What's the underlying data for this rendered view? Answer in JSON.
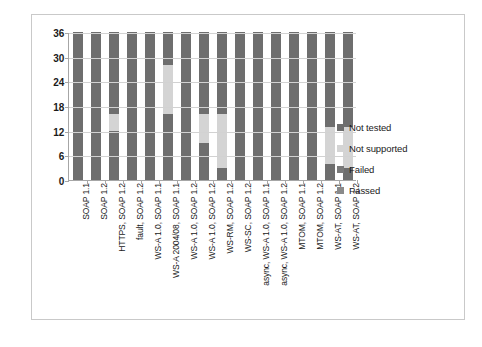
{
  "chart_data": {
    "type": "bar",
    "stacked": true,
    "title": "",
    "xlabel": "",
    "ylabel": "",
    "ylim": [
      0,
      36
    ],
    "yticks": [
      0,
      6,
      12,
      18,
      24,
      30,
      36
    ],
    "grid": true,
    "legend_position": "right",
    "categories": [
      "SOAP 1.1",
      "SOAP 1.2",
      "HTTPS, SOAP 1.2",
      "fault, SOAP 1.2",
      "WS-A 1.0, SOAP 1.1",
      "WS-A 2004/08, SOAP 1.1",
      "WS-A 1.0, SOAP 1.2",
      "WS-A 1.0, SOAP 1.2",
      "WS-RM, SOAP 1.2",
      "WS-SC, SOAP 1.2",
      "async, WS-A 1.0, SOAP 1.1",
      "async, WS-A 1.0, SOAP 1.2",
      "MTOM, SOAP 1.1",
      "MTOM, SOAP 1.2",
      "WS-AT, SOAP 1.1",
      "WS-AT, SOAP 1.2"
    ],
    "series": [
      {
        "name": "Passed",
        "color": "#6e6e6e",
        "values": [
          36,
          36,
          12,
          36,
          36,
          16,
          36,
          9,
          3,
          36,
          36,
          36,
          36,
          36,
          4,
          3
        ]
      },
      {
        "name": "Failed",
        "color": "#7f7f7f",
        "values": [
          0,
          0,
          0,
          0,
          0,
          0,
          0,
          0,
          0,
          0,
          0,
          0,
          0,
          0,
          0,
          0
        ]
      },
      {
        "name": "Not supported",
        "color": "#d4d4d4",
        "values": [
          0,
          0,
          4,
          0,
          0,
          12,
          0,
          7,
          13,
          0,
          0,
          0,
          0,
          0,
          9,
          10
        ]
      },
      {
        "name": "Not tested",
        "color": "#6e6e6e",
        "values": [
          0,
          0,
          20,
          0,
          0,
          8,
          0,
          20,
          20,
          0,
          0,
          0,
          0,
          0,
          23,
          23
        ]
      }
    ]
  },
  "legend": {
    "items": [
      {
        "label": "Not tested",
        "color": "#6e6e6e"
      },
      {
        "label": "Not supported",
        "color": "#d4d4d4"
      },
      {
        "label": "Failed",
        "color": "#7a7a7a"
      },
      {
        "label": "Passed",
        "color": "#8a8a8a"
      }
    ]
  }
}
